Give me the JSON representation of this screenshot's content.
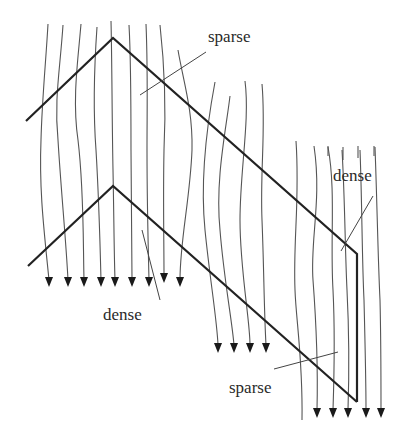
{
  "diagram": {
    "title": "",
    "labels": [
      {
        "id": "sparse-top",
        "text": "sparse",
        "x": 208,
        "y": 42,
        "leader": [
          [
            206,
            52
          ],
          [
            140,
            95
          ]
        ]
      },
      {
        "id": "dense-right",
        "text": "dense",
        "x": 333,
        "y": 181,
        "leader": [
          [
            373,
            196
          ],
          [
            341,
            251
          ]
        ]
      },
      {
        "id": "dense-bottom",
        "text": "dense",
        "x": 103,
        "y": 320,
        "leader": [
          [
            142,
            230
          ],
          [
            160,
            300
          ]
        ]
      },
      {
        "id": "sparse-bottom",
        "text": "sparse",
        "x": 229,
        "y": 393,
        "leader": [
          [
            274,
            369
          ],
          [
            338,
            352
          ]
        ]
      }
    ],
    "shape": {
      "upper_edge": [
        [
          26,
          121
        ],
        [
          113,
          38
        ],
        [
          357,
          254
        ],
        [
          357,
          402
        ]
      ],
      "lower_edge": [
        [
          28,
          266
        ],
        [
          113,
          186
        ],
        [
          357,
          402
        ]
      ]
    },
    "flow_lines": [
      {
        "d": "M48 24 C46 60 42 100 41 140 C39 190 44 230 49 280",
        "arrow": true,
        "end": [
          49,
          287
        ]
      },
      {
        "d": "M63 25 C60 70 54 100 58 140 C61 190 66 240 68 280",
        "arrow": true,
        "end": [
          68,
          287
        ]
      },
      {
        "d": "M81 24 C78 60 72 100 78 140 C84 190 83 240 84 280",
        "arrow": true,
        "end": [
          84,
          287
        ]
      },
      {
        "d": "M97 27 C94 70 93 110 96 150 C99 200 100 240 101 280",
        "arrow": true,
        "end": [
          101,
          287
        ]
      },
      {
        "d": "M111 21 C112 60 112 120 113 170 C114 220 114 250 115 280",
        "arrow": true,
        "end": [
          115,
          287
        ]
      },
      {
        "d": "M129 25 C131 60 131 110 131 150 C131 200 132 240 132 280",
        "arrow": true,
        "end": [
          132,
          287
        ]
      },
      {
        "d": "M146 24 C148 70 147 110 147 150 C147 200 148 240 149 280",
        "arrow": true,
        "end": [
          149,
          287
        ]
      },
      {
        "d": "M160 25 C165 70 166 110 164 150 C163 200 164 240 164 276",
        "arrow": true,
        "end": [
          164,
          283
        ]
      },
      {
        "d": "M178 50 C183 80 193 110 192 150 C190 200 180 240 180 280",
        "arrow": true,
        "end": [
          180,
          287
        ]
      },
      {
        "d": "M215 82 C206 130 200 180 205 230 C210 280 217 320 218 345",
        "arrow": true,
        "end": [
          218,
          353
        ]
      },
      {
        "d": "M230 96 C226 130 215 180 220 230 C224 280 232 320 234 345",
        "arrow": true,
        "end": [
          234,
          353
        ]
      },
      {
        "d": "M245 81 C250 120 240 170 240 220 C240 270 250 320 250 345",
        "arrow": true,
        "end": [
          250,
          353
        ]
      },
      {
        "d": "M262 84 C266 130 260 170 262 220 C264 270 264 310 266 345",
        "arrow": true,
        "end": [
          266,
          353
        ]
      },
      {
        "d": "M296 141 C300 200 293 240 295 290 C296 320 303 360 302 420",
        "arrow": false,
        "end": null
      },
      {
        "d": "M314 146 C322 200 310 240 313 280 C316 320 318 370 317 410",
        "arrow": true,
        "end": [
          317,
          418
        ]
      },
      {
        "d": "M328 147 C336 190 330 240 333 290 C335 330 334 380 333 410",
        "arrow": true,
        "end": [
          333,
          418
        ]
      },
      {
        "d": "M342 150 C345 200 345 250 347 290 C349 330 349 380 348 410",
        "arrow": true,
        "end": [
          348,
          418
        ]
      },
      {
        "d": "M360 150 C362 200 362 260 364 300 C365 340 366 380 366 410",
        "arrow": true,
        "end": [
          366,
          418
        ]
      },
      {
        "d": "M375 147 C377 200 378 260 380 300 C381 340 381 380 381 410",
        "arrow": true,
        "end": [
          381,
          418
        ]
      }
    ],
    "short_ticks": [
      {
        "d": "M328 146 L328 156"
      },
      {
        "d": "M343 147 L343 160"
      },
      {
        "d": "M358 146 L358 158"
      },
      {
        "d": "M374 146 L374 156"
      }
    ]
  }
}
